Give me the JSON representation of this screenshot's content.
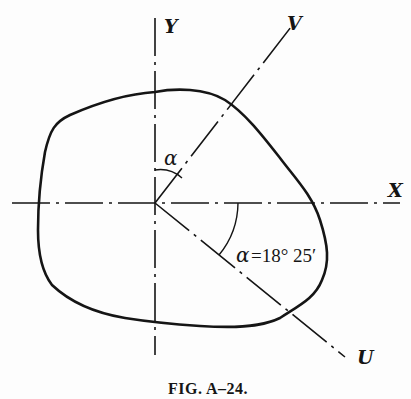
{
  "figure": {
    "caption": "Fig. A–24.",
    "caption_display": "FIG. A–24.",
    "axes": {
      "x_label": "X",
      "y_label": "Y",
      "v_label": "V",
      "u_label": "U"
    },
    "angle_labels": {
      "upper": "α",
      "lower_symbol": "α",
      "lower_value": "=18° 25′"
    },
    "angle_value": "18° 25′",
    "colors": {
      "ink": "#151515",
      "paper": "#fdfdfd"
    }
  }
}
